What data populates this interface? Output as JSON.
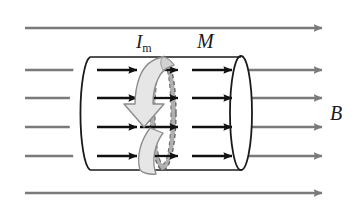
{
  "figure": {
    "labels": {
      "bound_current": {
        "symbol": "I",
        "subscript": "m",
        "x": 136,
        "y": 48
      },
      "magnetization": {
        "symbol": "M",
        "x": 197,
        "y": 48
      },
      "magnetic_field": {
        "symbol": "B",
        "x": 332,
        "y": 114
      }
    },
    "colors": {
      "outline": "#1a1a1a",
      "field_line": "#7a7a7a",
      "loop_band_fill": "#a9a9a9",
      "loop_band_stroke": "#6e6e6e",
      "block_arrow_fill": "#e6e6e6",
      "block_arrow_stroke": "#8c8c8c",
      "internal_arrow": "#111111",
      "background": "#ffffff"
    },
    "cylinder": {
      "left_face_center_x": 90,
      "right_face_center_x": 241,
      "center_y": 113,
      "radius_y": 57,
      "radius_x": 11,
      "top_y": 57,
      "bottom_y": 170
    },
    "bound_current_loop": {
      "center_x": 163,
      "center_y": 113,
      "radius_x": 13,
      "radius_y": 57,
      "style": "dashed",
      "description": "surface bound current ring around cylinder"
    },
    "field_lines": [
      {
        "name": "field-line-1",
        "y": 28,
        "x_start": 25,
        "x_end": 325,
        "clipped": false
      },
      {
        "name": "field-line-2",
        "y": 70,
        "x_start": 25,
        "x_end": 325,
        "clipped": true
      },
      {
        "name": "field-line-3",
        "y": 98,
        "x_start": 25,
        "x_end": 325,
        "clipped": true
      },
      {
        "name": "field-line-4",
        "y": 127,
        "x_start": 25,
        "x_end": 325,
        "clipped": true
      },
      {
        "name": "field-line-5",
        "y": 156,
        "x_start": 25,
        "x_end": 325,
        "clipped": true
      },
      {
        "name": "field-line-6",
        "y": 193,
        "x_start": 25,
        "x_end": 325,
        "clipped": false
      }
    ],
    "magnetization_arrows": {
      "rows_y": [
        70,
        98,
        127,
        156
      ],
      "columns_x_start": [
        97,
        148,
        196
      ],
      "length": 42,
      "count": 12
    },
    "circulation_arrow": {
      "description": "thick 3D block arrow showing circulation sense of bound current, pointing down on the front-left of the loop",
      "direction": "counterclockwise-front-down"
    }
  }
}
